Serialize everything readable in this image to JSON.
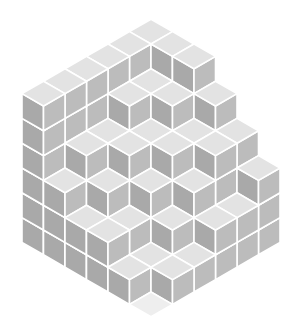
{
  "illustration": {
    "name": "isometric stacked cubes in hexagon",
    "colors": {
      "background": "#ffffff",
      "top_face": "#e3e3e3",
      "left_face": "#a9a9a9",
      "right_face": "#bcbcbc",
      "floor_face": "#eeeeee",
      "gap": "#ffffff"
    },
    "geometry": {
      "center_x": 151,
      "center_y": 168,
      "half_width": 21.5,
      "rise": 12.4,
      "box_size": 6
    },
    "height_map": [
      [
        6,
        6,
        6,
        6,
        6,
        6
      ],
      [
        6,
        5,
        5,
        4,
        4,
        3
      ],
      [
        6,
        5,
        4,
        4,
        3,
        2
      ],
      [
        5,
        4,
        4,
        3,
        2,
        2
      ],
      [
        4,
        4,
        3,
        2,
        1,
        1
      ],
      [
        3,
        2,
        2,
        1,
        1,
        0
      ]
    ]
  }
}
